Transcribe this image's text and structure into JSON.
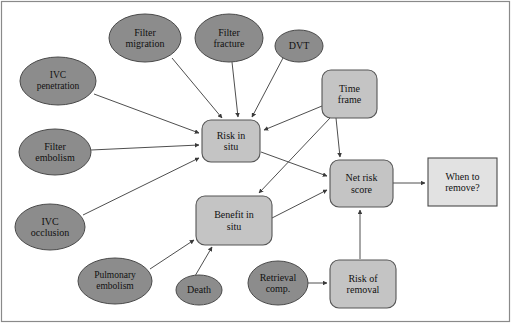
{
  "figure": {
    "type": "influence-diagram",
    "title_visible": false,
    "frame_color": "#8a8a8a",
    "background": "#ffffff"
  },
  "style": {
    "ellipse_fill": "#8c8c8c",
    "ellipse_stroke": "#4a4a4a",
    "rounded_fill": "#c4c4c4",
    "rounded_stroke": "#555555",
    "outcome_fill": "#e2e2e2",
    "outcome_stroke": "#4a4a4a",
    "edge_color": "#3a3a3a",
    "text_color": "#111111"
  },
  "nodes": [
    {
      "id": "filter_migration",
      "label": "Filter\nmigration",
      "shape": "ellipse",
      "cx": 145,
      "cy": 38,
      "rx": 36,
      "ry": 24
    },
    {
      "id": "filter_fracture",
      "label": "Filter\nfracture",
      "shape": "ellipse",
      "cx": 229,
      "cy": 38,
      "rx": 34,
      "ry": 24
    },
    {
      "id": "dvt",
      "label": "DVT",
      "shape": "ellipse",
      "cx": 299,
      "cy": 46,
      "rx": 24,
      "ry": 16
    },
    {
      "id": "ivc_penetration",
      "label": "IVC\npenetration",
      "shape": "ellipse",
      "cx": 58,
      "cy": 81,
      "rx": 38,
      "ry": 24
    },
    {
      "id": "time_frame",
      "label": "Time\nframe",
      "shape": "rounded",
      "x": 322,
      "y": 70,
      "w": 55,
      "h": 48
    },
    {
      "id": "filter_embolism",
      "label": "Filter\nembolism",
      "shape": "ellipse",
      "cx": 55,
      "cy": 152,
      "rx": 36,
      "ry": 23
    },
    {
      "id": "risk_in_situ",
      "label": "Risk in\nsitu",
      "shape": "rounded",
      "x": 202,
      "y": 120,
      "w": 58,
      "h": 42
    },
    {
      "id": "net_risk_score",
      "label": "Net risk\nscore",
      "shape": "rounded",
      "x": 330,
      "y": 160,
      "w": 63,
      "h": 47
    },
    {
      "id": "when_to_remove",
      "label": "When to\nremove?",
      "shape": "rect",
      "x": 428,
      "y": 158,
      "w": 69,
      "h": 48
    },
    {
      "id": "ivc_occlusion",
      "label": "IVC\nocclusion",
      "shape": "ellipse",
      "cx": 50,
      "cy": 227,
      "rx": 35,
      "ry": 23
    },
    {
      "id": "benefit_in_situ",
      "label": "Benefit in\nsitu",
      "shape": "rounded",
      "x": 196,
      "y": 196,
      "w": 76,
      "h": 49
    },
    {
      "id": "pulmonary_embolism",
      "label": "Pulmonary\nembolism",
      "shape": "ellipse",
      "cx": 115,
      "cy": 281,
      "rx": 37,
      "ry": 23
    },
    {
      "id": "death",
      "label": "Death",
      "shape": "ellipse",
      "cx": 199,
      "cy": 290,
      "rx": 23,
      "ry": 15
    },
    {
      "id": "retrieval_comp",
      "label": "Retrieval\ncomp.",
      "shape": "ellipse",
      "cx": 278,
      "cy": 283,
      "rx": 30,
      "ry": 22
    },
    {
      "id": "risk_of_removal",
      "label": "Risk of\nremoval",
      "shape": "rounded",
      "x": 330,
      "y": 260,
      "w": 66,
      "h": 48
    }
  ],
  "edges": [
    {
      "from": "filter_migration",
      "to": "risk_in_situ",
      "points": "172,58 222,118"
    },
    {
      "from": "filter_fracture",
      "to": "risk_in_situ",
      "points": "232,62 238,117"
    },
    {
      "from": "dvt",
      "to": "risk_in_situ",
      "points": "283,58 252,117"
    },
    {
      "from": "ivc_penetration",
      "to": "risk_in_situ",
      "points": "94,94 199,133"
    },
    {
      "from": "time_frame",
      "to": "risk_in_situ",
      "points": "322,106 264,130"
    },
    {
      "from": "filter_embolism",
      "to": "risk_in_situ",
      "points": "91,150 199,145"
    },
    {
      "from": "ivc_occlusion",
      "to": "risk_in_situ",
      "points": "83,215 199,158"
    },
    {
      "from": "time_frame",
      "to": "benefit_in_situ",
      "points": "330,118 259,193"
    },
    {
      "from": "time_frame",
      "to": "net_risk_score",
      "points": "336,118 340,157"
    },
    {
      "from": "risk_in_situ",
      "to": "net_risk_score",
      "points": "261,152 327,176"
    },
    {
      "from": "benefit_in_situ",
      "to": "net_risk_score",
      "points": "272,218 327,190"
    },
    {
      "from": "pulmonary_embolism",
      "to": "benefit_in_situ",
      "points": "150,269 194,240"
    },
    {
      "from": "death",
      "to": "benefit_in_situ",
      "points": "195,276 212,247"
    },
    {
      "from": "retrieval_comp",
      "to": "risk_of_removal",
      "points": "308,283 327,283"
    },
    {
      "from": "risk_of_removal",
      "to": "net_risk_score",
      "points": "360,259 360,210"
    },
    {
      "from": "net_risk_score",
      "to": "when_to_remove",
      "points": "393,183 425,183"
    }
  ]
}
